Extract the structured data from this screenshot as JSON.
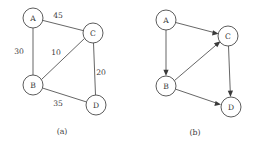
{
  "figure": {
    "background_color": "#ffffff",
    "stroke_color": "#4a4a4a",
    "text_color": "#3a3a3a"
  },
  "panel_a": {
    "caption": "(a)",
    "nodes": [
      {
        "id": "A",
        "label": "A",
        "cx": 33,
        "cy": 18,
        "r": 10
      },
      {
        "id": "C",
        "label": "C",
        "cx": 93,
        "cy": 33,
        "r": 10
      },
      {
        "id": "B",
        "label": "B",
        "cx": 33,
        "cy": 85,
        "r": 10
      },
      {
        "id": "D",
        "label": "D",
        "cx": 96,
        "cy": 105,
        "r": 10
      }
    ],
    "edges": [
      {
        "from": "A",
        "to": "C",
        "weight": "45",
        "label_x": 58,
        "label_y": 15
      },
      {
        "from": "A",
        "to": "B",
        "weight": "30",
        "label_x": 19,
        "label_y": 51
      },
      {
        "from": "B",
        "to": "C",
        "weight": "10",
        "label_x": 56,
        "label_y": 52
      },
      {
        "from": "C",
        "to": "D",
        "weight": "20",
        "label_x": 101,
        "label_y": 72
      },
      {
        "from": "B",
        "to": "D",
        "weight": "35",
        "label_x": 58,
        "label_y": 103
      }
    ]
  },
  "panel_b": {
    "caption": "(b)",
    "nodes": [
      {
        "id": "A",
        "label": "A",
        "cx": 39,
        "cy": 20,
        "r": 10
      },
      {
        "id": "C",
        "label": "C",
        "cx": 101,
        "cy": 36,
        "r": 10
      },
      {
        "id": "B",
        "label": "B",
        "cx": 39,
        "cy": 86,
        "r": 10
      },
      {
        "id": "D",
        "label": "D",
        "cx": 104,
        "cy": 107,
        "r": 10
      }
    ],
    "edges": [
      {
        "from": "A",
        "to": "C",
        "directed": true
      },
      {
        "from": "A",
        "to": "B",
        "directed": true
      },
      {
        "from": "B",
        "to": "C",
        "directed": true
      },
      {
        "from": "B",
        "to": "D",
        "directed": true
      },
      {
        "from": "C",
        "to": "D",
        "directed": true
      }
    ]
  }
}
